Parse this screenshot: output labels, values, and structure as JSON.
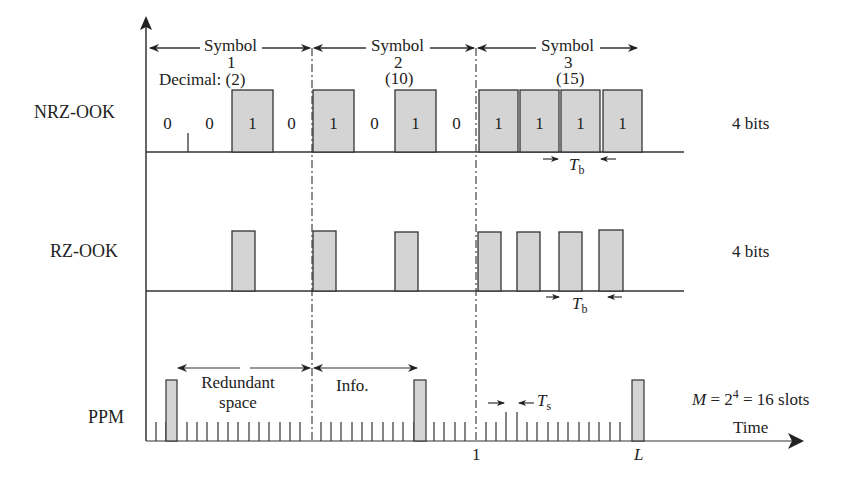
{
  "rows": {
    "nrz": {
      "label": "NRZ-OOK",
      "bits_label": "4 bits"
    },
    "rz": {
      "label": "RZ-OOK",
      "bits_label": "4 bits"
    },
    "ppm": {
      "label": "PPM",
      "slots_label": "M = 2⁴ = 16 slots"
    }
  },
  "symbols": [
    {
      "title": "Symbol",
      "index": "1",
      "decimal": "Decimal: (2)",
      "bits": [
        "0",
        "0",
        "1",
        "0"
      ]
    },
    {
      "title": "Symbol",
      "index": "2",
      "decimal": "(10)",
      "bits": [
        "1",
        "0",
        "1",
        "0"
      ]
    },
    {
      "title": "Symbol",
      "index": "3",
      "decimal": "(15)",
      "bits": [
        "1",
        "1",
        "1",
        "1"
      ]
    }
  ],
  "annotations": {
    "tb_nrz": "T",
    "tb_nrz_sub": "b",
    "tb_rz": "T",
    "tb_rz_sub": "b",
    "ts": "T",
    "ts_sub": "s",
    "redundant": "Redundant",
    "redundant2": "space",
    "info": "Info.",
    "time": "Time",
    "slot_one": "1",
    "slot_L": "L",
    "m_eq": "M",
    "m_rest": " = 2",
    "m_exp": "4",
    "m_tail": " = 16 slots"
  },
  "colors": {
    "pulse_fill": "#d4d4d4",
    "line": "#333333"
  }
}
